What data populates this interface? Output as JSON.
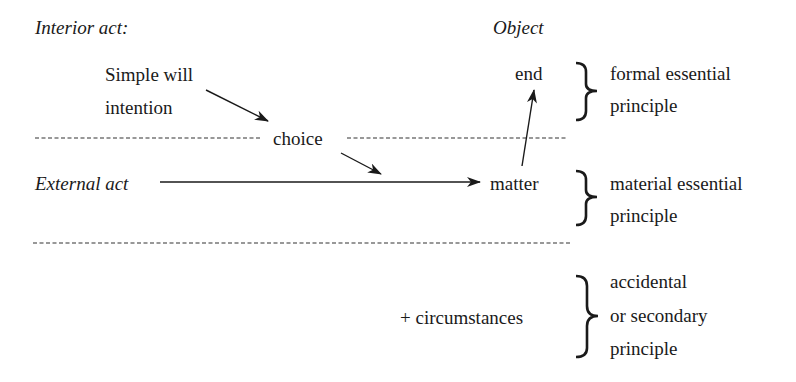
{
  "headers": {
    "interior_act": "Interior act:",
    "object": "Object"
  },
  "interior": {
    "simple_will_line1": "Simple will",
    "simple_will_line2": "intention",
    "choice": "choice"
  },
  "external": {
    "label": "External act"
  },
  "object_column": {
    "end": "end",
    "matter": "matter",
    "circumstances": "+ circumstances"
  },
  "principles": [
    {
      "line1": "formal essential",
      "line2": "principle"
    },
    {
      "line1": "material essential",
      "line2": "principle"
    },
    {
      "line1": "accidental",
      "line2": "or secondary",
      "line3": "principle"
    }
  ],
  "colors": {
    "ink": "#1a1a1a",
    "background": "#ffffff"
  }
}
